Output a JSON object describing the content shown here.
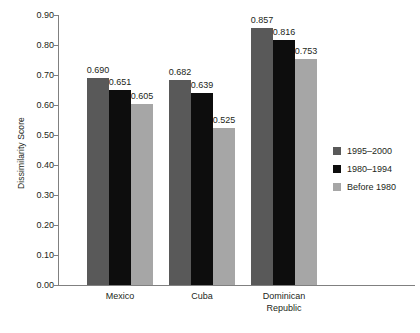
{
  "chart_data": {
    "type": "bar",
    "title": "",
    "xlabel": "",
    "ylabel": "Dissimilarity Score",
    "categories": [
      "Mexico",
      "Cuba",
      "Dominican Republic"
    ],
    "category_lines": [
      [
        "Mexico"
      ],
      [
        "Cuba"
      ],
      [
        "Dominican",
        "Republic"
      ]
    ],
    "series": [
      {
        "name": "1995–2000",
        "color": "#595959",
        "values": [
          0.69,
          0.682,
          0.857
        ],
        "labels": [
          "0.690",
          "0.682",
          "0.857"
        ]
      },
      {
        "name": "1980–1994",
        "color": "#0d0d0d",
        "values": [
          0.651,
          0.639,
          0.816
        ],
        "labels": [
          "0.651",
          "0.639",
          "0.816"
        ]
      },
      {
        "name": "Before 1980",
        "color": "#a6a6a6",
        "values": [
          0.605,
          0.525,
          0.753
        ],
        "labels": [
          "0.605",
          "0.525",
          "0.753"
        ]
      }
    ],
    "ylim": [
      0.0,
      0.9
    ],
    "ytick_values": [
      0.0,
      0.1,
      0.2,
      0.3,
      0.4,
      0.5,
      0.6,
      0.7,
      0.8,
      0.9
    ],
    "ytick_labels": [
      "0.00",
      "0.10",
      "0.20",
      "0.30",
      "0.40",
      "0.50",
      "0.60",
      "0.70",
      "0.80",
      "0.90"
    ],
    "grid": false,
    "legend_position": "right",
    "legend_entries": [
      "1995–2000",
      "1980–1994",
      "Before 1980"
    ],
    "axis_color": "#808080",
    "text_color": "#231f20",
    "background": "#ffffff"
  }
}
